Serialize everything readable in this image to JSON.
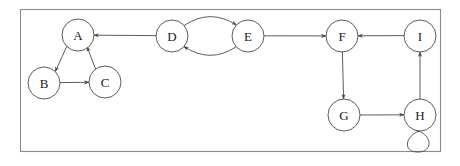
{
  "figure": {
    "background_color": "#ffffff",
    "frame": {
      "x": 20,
      "y": 9,
      "width": 421,
      "height": 143,
      "stroke_color": "#8a8a8a"
    }
  },
  "graph": {
    "type": "directed-graph",
    "node_radius": 16,
    "node_stroke_color": "#4a4a4a",
    "node_fill_color": "#ffffff",
    "edge_stroke_color": "#4a4a4a",
    "label_color": "#1a1a1a",
    "nodes": [
      {
        "id": "A",
        "label": "A",
        "cx": 78,
        "cy": 35
      },
      {
        "id": "B",
        "label": "B",
        "cx": 44,
        "cy": 83
      },
      {
        "id": "C",
        "label": "C",
        "cx": 105,
        "cy": 82
      },
      {
        "id": "D",
        "label": "D",
        "cx": 172,
        "cy": 36
      },
      {
        "id": "E",
        "label": "E",
        "cx": 248,
        "cy": 36
      },
      {
        "id": "F",
        "label": "F",
        "cx": 342,
        "cy": 36
      },
      {
        "id": "G",
        "label": "G",
        "cx": 344,
        "cy": 115
      },
      {
        "id": "H",
        "label": "H",
        "cx": 420,
        "cy": 115
      },
      {
        "id": "I",
        "label": "I",
        "cx": 420,
        "cy": 36
      }
    ],
    "edges": [
      {
        "from": "A",
        "to": "B",
        "style": "straight"
      },
      {
        "from": "B",
        "to": "C",
        "style": "straight"
      },
      {
        "from": "C",
        "to": "A",
        "style": "straight"
      },
      {
        "from": "D",
        "to": "E",
        "style": "curved-upper"
      },
      {
        "from": "E",
        "to": "D",
        "style": "curved-lower"
      },
      {
        "from": "D",
        "to": "A",
        "style": "straight"
      },
      {
        "from": "E",
        "to": "F",
        "style": "straight"
      },
      {
        "from": "I",
        "to": "F",
        "style": "straight"
      },
      {
        "from": "F",
        "to": "G",
        "style": "straight"
      },
      {
        "from": "G",
        "to": "H",
        "style": "straight"
      },
      {
        "from": "H",
        "to": "I",
        "style": "straight"
      },
      {
        "from": "H",
        "to": "H",
        "style": "self-loop-below"
      }
    ]
  }
}
